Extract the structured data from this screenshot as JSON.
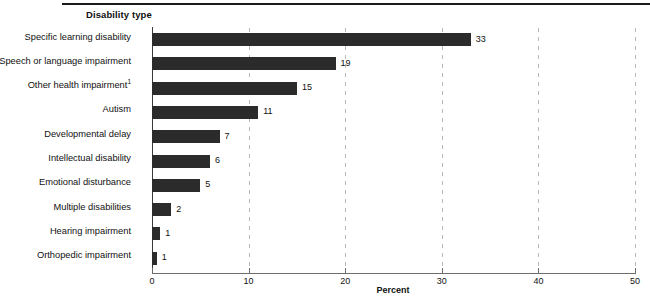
{
  "figure": {
    "y_axis_heading": "Disability type",
    "x_axis_title": "Percent"
  },
  "axis": {
    "ticks": [
      "0",
      "10",
      "20",
      "30",
      "40",
      "50"
    ]
  },
  "chart_data": {
    "type": "bar",
    "orientation": "horizontal",
    "title": "",
    "subtitle": "",
    "xlabel": "Percent",
    "ylabel": "Disability type",
    "xlim": [
      0,
      50
    ],
    "xticks": [
      0,
      10,
      20,
      30,
      40,
      50
    ],
    "grid": "vertical dashed gridlines at 10, 20, 30, 40",
    "legend": "none",
    "categories": [
      "Specific learning disability",
      "Speech or language impairment",
      "Other health impairment",
      "Autism",
      "Developmental delay",
      "Intellectual disability",
      "Emotional disturbance",
      "Multiple disabilities",
      "Hearing impairment",
      "Orthopedic impairment"
    ],
    "values": [
      33,
      19,
      15,
      11,
      7,
      6,
      5,
      2,
      1,
      1
    ],
    "data_labels": [
      "33",
      "19",
      "15",
      "11",
      "7",
      "6",
      "5",
      "2",
      "1",
      "1"
    ],
    "bar_draw_values": [
      33,
      19,
      15,
      11,
      7,
      6,
      5,
      2,
      0.85,
      0.5
    ],
    "footnotes": {
      "Other health impairment": "1"
    },
    "bar_color": "#2b2b2b",
    "gridline_color": "#b9b9b9",
    "axis_color": "#6d6d6d"
  }
}
